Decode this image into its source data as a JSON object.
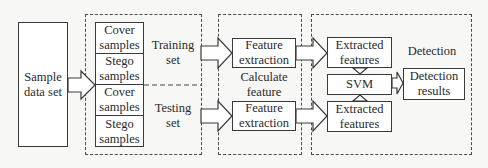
{
  "diagram": {
    "source": {
      "label": "Sample data set"
    },
    "datasets_group": {
      "training": {
        "label": "Training set",
        "cells": [
          "Cover samples",
          "Stego samples"
        ]
      },
      "testing": {
        "label": "Testing set",
        "cells": [
          "Cover samples",
          "Stego samples"
        ]
      }
    },
    "feature_group": {
      "label": "Calculate feature",
      "top_box": "Feature extraction",
      "bottom_box": "Feature extraction"
    },
    "detection_group": {
      "label": "Detection",
      "top_box": "Extracted features",
      "classifier": "SVM",
      "bottom_box": "Extracted features",
      "result_box": "Detection results"
    },
    "colors": {
      "stroke": "#3a3a3a",
      "background": "#f7f7f5",
      "box_fill": "#ffffff"
    }
  }
}
